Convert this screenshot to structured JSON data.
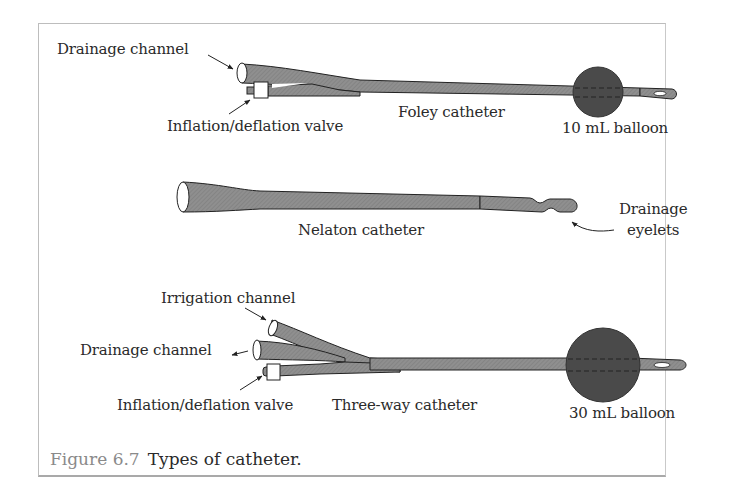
{
  "figure": {
    "caption_number": "Figure 6.7",
    "caption_text": "Types of catheter.",
    "colors": {
      "tube_fill": "#8c8c8c",
      "balloon_fill": "#4a4a4a",
      "outline": "#222222",
      "caption_number": "#8a8a8a",
      "frame_border": "#bdbdbd"
    }
  },
  "foley": {
    "name": "Foley catheter",
    "labels": {
      "drainage_channel": "Drainage channel",
      "inflation_valve": "Inflation/deflation valve",
      "balloon": "10 mL balloon"
    }
  },
  "nelaton": {
    "name": "Nelaton catheter",
    "labels": {
      "eyelets_line1": "Drainage",
      "eyelets_line2": "eyelets"
    }
  },
  "three_way": {
    "name": "Three-way catheter",
    "labels": {
      "irrigation_channel": "Irrigation channel",
      "drainage_channel": "Drainage channel",
      "inflation_valve": "Inflation/deflation valve",
      "balloon": "30 mL balloon"
    }
  }
}
